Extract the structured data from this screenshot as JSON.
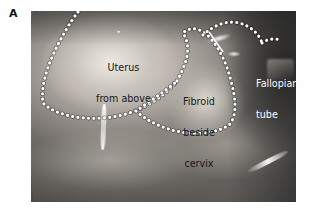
{
  "figure": {
    "panel_label": "A",
    "image_type": "laparoscopic-photograph"
  },
  "annotations": [
    {
      "id": "uterus",
      "line1": "Uterus",
      "line2": "from above",
      "text_color": "#17181a",
      "style": "dark-text"
    },
    {
      "id": "fibroid",
      "line1": "Fibroid",
      "line2": "beside",
      "line3": "cervix",
      "text_color": "#17181a",
      "style": "dark-text"
    },
    {
      "id": "fallopian-tube",
      "line1": "Fallopian",
      "line2": "tube",
      "text_color": "#ffffff",
      "style": "light-text-with-leader-line"
    }
  ],
  "outlines": [
    {
      "id": "uterus-outline",
      "marker": "white-dotted-arc",
      "color": "#ffffff"
    },
    {
      "id": "fibroid-outline",
      "marker": "white-dotted-loop",
      "color": "#ffffff"
    },
    {
      "id": "fallopian-tube-outline",
      "marker": "white-dotted-hook",
      "color": "#ffffff"
    }
  ],
  "colors": {
    "dot_outline": "#ffffff",
    "dark_label": "#17181a",
    "light_label": "#ffffff",
    "panel_label": "#111111",
    "background": "#ffffff"
  }
}
